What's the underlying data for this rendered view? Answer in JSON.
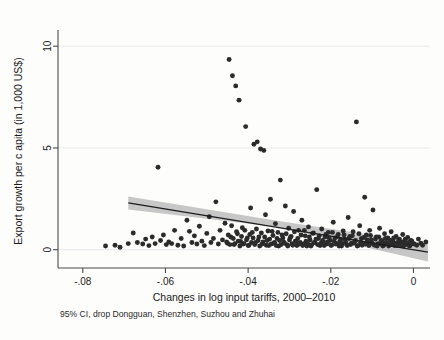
{
  "chart_data": {
    "type": "scatter",
    "title": "",
    "xlabel": "Changes in log input tariffs, 2000–2010",
    "ylabel": "Export growth per c apita (in 1,000 US$)",
    "note": "95% CI, drop Dongguan, Shenzhen, Suzhou and Zhuhai",
    "xlim": [
      -0.086,
      0.004
    ],
    "ylim": [
      -0.9,
      10.6
    ],
    "xticks": [
      -0.08,
      -0.06,
      -0.04,
      -0.02,
      0
    ],
    "xticklabels": [
      "-.08",
      "-.06",
      "-.04",
      "-.02",
      "0"
    ],
    "yticks": [
      0,
      5,
      10
    ],
    "yticklabels": [
      "0",
      "5",
      "10"
    ],
    "grid": "horizontal",
    "legend": "none",
    "marker_color": "#2b2b2b",
    "line_color": "#1c1c1c",
    "ci_color": "#9a9a9a",
    "background_color": "#fdfdfc",
    "series": [
      {
        "name": "Cities",
        "points": [
          [
            -0.0745,
            0.18
          ],
          [
            -0.0722,
            0.22
          ],
          [
            -0.071,
            0.12
          ],
          [
            -0.069,
            0.3
          ],
          [
            -0.0678,
            0.82
          ],
          [
            -0.0668,
            0.35
          ],
          [
            -0.0655,
            0.28
          ],
          [
            -0.0648,
            0.52
          ],
          [
            -0.064,
            0.2
          ],
          [
            -0.0632,
            0.62
          ],
          [
            -0.0625,
            0.3
          ],
          [
            -0.0618,
            4.05
          ],
          [
            -0.0612,
            0.45
          ],
          [
            -0.0605,
            0.72
          ],
          [
            -0.0598,
            0.25
          ],
          [
            -0.0592,
            0.38
          ],
          [
            -0.0585,
            0.3
          ],
          [
            -0.0578,
            0.95
          ],
          [
            -0.057,
            0.22
          ],
          [
            -0.0562,
            0.55
          ],
          [
            -0.0556,
            0.18
          ],
          [
            -0.0548,
            1.45
          ],
          [
            -0.0542,
            0.9
          ],
          [
            -0.0536,
            0.35
          ],
          [
            -0.053,
            0.68
          ],
          [
            -0.0524,
            0.28
          ],
          [
            -0.0518,
            1.15
          ],
          [
            -0.0512,
            0.42
          ],
          [
            -0.0506,
            0.2
          ],
          [
            -0.05,
            0.8
          ],
          [
            -0.0494,
            1.62
          ],
          [
            -0.049,
            0.35
          ],
          [
            -0.0484,
            0.55
          ],
          [
            -0.0478,
            2.35
          ],
          [
            -0.0472,
            0.28
          ],
          [
            -0.0468,
            0.95
          ],
          [
            -0.0462,
            0.48
          ],
          [
            -0.0456,
            1.3
          ],
          [
            -0.045,
            0.32
          ],
          [
            -0.0446,
            9.35
          ],
          [
            -0.0442,
            0.62
          ],
          [
            -0.0438,
            8.55
          ],
          [
            -0.0434,
            0.25
          ],
          [
            -0.043,
            8.05
          ],
          [
            -0.0426,
            0.78
          ],
          [
            -0.0422,
            7.35
          ],
          [
            -0.0418,
            0.4
          ],
          [
            -0.0414,
            1.08
          ],
          [
            -0.041,
            0.3
          ],
          [
            -0.0406,
            6.05
          ],
          [
            -0.0402,
            0.58
          ],
          [
            -0.0398,
            0.22
          ],
          [
            -0.0394,
            2.05
          ],
          [
            -0.039,
            0.85
          ],
          [
            -0.0386,
            5.18
          ],
          [
            -0.0382,
            0.35
          ],
          [
            -0.0378,
            5.3
          ],
          [
            -0.0374,
            0.62
          ],
          [
            -0.037,
            4.95
          ],
          [
            -0.0366,
            0.28
          ],
          [
            -0.0362,
            4.88
          ],
          [
            -0.0358,
            1.72
          ],
          [
            -0.0354,
            0.45
          ],
          [
            -0.035,
            0.2
          ],
          [
            -0.0346,
            2.48
          ],
          [
            -0.0342,
            0.9
          ],
          [
            -0.0338,
            0.32
          ],
          [
            -0.0334,
            1.28
          ],
          [
            -0.033,
            0.55
          ],
          [
            -0.0326,
            0.18
          ],
          [
            -0.0322,
            3.42
          ],
          [
            -0.0318,
            0.72
          ],
          [
            -0.0314,
            0.38
          ],
          [
            -0.031,
            2.15
          ],
          [
            -0.0306,
            0.25
          ],
          [
            -0.0302,
            1.05
          ],
          [
            -0.0298,
            0.6
          ],
          [
            -0.0294,
            0.3
          ],
          [
            -0.029,
            1.88
          ],
          [
            -0.0286,
            0.42
          ],
          [
            -0.0282,
            0.2
          ],
          [
            -0.0278,
            0.95
          ],
          [
            -0.0274,
            0.35
          ],
          [
            -0.027,
            1.45
          ],
          [
            -0.0266,
            0.28
          ],
          [
            -0.0262,
            0.68
          ],
          [
            -0.0258,
            0.18
          ],
          [
            -0.0254,
            1.12
          ],
          [
            -0.025,
            0.48
          ],
          [
            -0.0246,
            0.25
          ],
          [
            -0.0242,
            0.82
          ],
          [
            -0.0238,
            0.35
          ],
          [
            -0.0234,
            2.95
          ],
          [
            -0.023,
            0.55
          ],
          [
            -0.0226,
            0.2
          ],
          [
            -0.0222,
            1.02
          ],
          [
            -0.0218,
            0.38
          ],
          [
            -0.0214,
            0.62
          ],
          [
            -0.021,
            0.28
          ],
          [
            -0.0206,
            0.85
          ],
          [
            -0.0202,
            0.45
          ],
          [
            -0.0198,
            0.22
          ],
          [
            -0.0194,
            1.35
          ],
          [
            -0.019,
            0.58
          ],
          [
            -0.0186,
            0.3
          ],
          [
            -0.0182,
            0.75
          ],
          [
            -0.0178,
            0.4
          ],
          [
            -0.0174,
            0.18
          ],
          [
            -0.017,
            0.92
          ],
          [
            -0.0166,
            0.52
          ],
          [
            -0.0162,
            0.25
          ],
          [
            -0.0158,
            1.58
          ],
          [
            -0.0154,
            0.65
          ],
          [
            -0.015,
            0.32
          ],
          [
            -0.0146,
            0.88
          ],
          [
            -0.0142,
            0.42
          ],
          [
            -0.0138,
            6.28
          ],
          [
            -0.0134,
            0.2
          ],
          [
            -0.013,
            1.18
          ],
          [
            -0.0126,
            0.55
          ],
          [
            -0.0122,
            0.28
          ],
          [
            -0.0118,
            2.58
          ],
          [
            -0.0114,
            0.72
          ],
          [
            -0.011,
            0.35
          ],
          [
            -0.0106,
            0.95
          ],
          [
            -0.0102,
            0.48
          ],
          [
            -0.0098,
            1.95
          ],
          [
            -0.0094,
            0.22
          ],
          [
            -0.009,
            0.62
          ],
          [
            -0.0086,
            0.3
          ],
          [
            -0.0082,
            1.05
          ],
          [
            -0.0078,
            0.45
          ],
          [
            -0.0074,
            0.18
          ],
          [
            -0.007,
            0.78
          ],
          [
            -0.0066,
            0.35
          ],
          [
            -0.0062,
            0.58
          ],
          [
            -0.0058,
            0.25
          ],
          [
            -0.0054,
            0.88
          ],
          [
            -0.005,
            0.4
          ],
          [
            -0.0046,
            0.2
          ],
          [
            -0.0042,
            0.65
          ],
          [
            -0.0038,
            0.32
          ],
          [
            -0.0034,
            0.52
          ],
          [
            -0.003,
            0.22
          ],
          [
            -0.0026,
            0.75
          ],
          [
            -0.0022,
            0.38
          ],
          [
            -0.0018,
            0.28
          ],
          [
            -0.0014,
            0.6
          ],
          [
            -0.001,
            0.18
          ],
          [
            -0.0006,
            0.45
          ],
          [
            -0.0002,
            0.3
          ],
          [
            0.0012,
            0.52
          ],
          [
            0.0022,
            0.22
          ],
          [
            0.003,
            0.38
          ],
          [
            -0.0452,
            0.38
          ],
          [
            -0.0448,
            0.72
          ],
          [
            -0.0444,
            0.25
          ],
          [
            -0.044,
            1.18
          ],
          [
            -0.0436,
            0.55
          ],
          [
            -0.0432,
            0.3
          ],
          [
            -0.0428,
            0.88
          ],
          [
            -0.0424,
            0.42
          ],
          [
            -0.042,
            0.18
          ],
          [
            -0.0416,
            0.65
          ],
          [
            -0.0412,
            0.28
          ],
          [
            -0.0408,
            0.95
          ],
          [
            -0.0404,
            0.48
          ],
          [
            -0.04,
            0.2
          ],
          [
            -0.0396,
            0.75
          ],
          [
            -0.0392,
            0.35
          ],
          [
            -0.0388,
            0.58
          ],
          [
            -0.0384,
            0.25
          ],
          [
            -0.038,
            1.02
          ],
          [
            -0.0376,
            0.45
          ],
          [
            -0.0372,
            0.18
          ],
          [
            -0.0368,
            0.82
          ],
          [
            -0.0364,
            0.38
          ],
          [
            -0.036,
            0.62
          ],
          [
            -0.0356,
            0.22
          ],
          [
            -0.0352,
            0.92
          ],
          [
            -0.0348,
            0.52
          ],
          [
            -0.0344,
            0.28
          ],
          [
            -0.034,
            0.7
          ],
          [
            -0.0336,
            0.35
          ],
          [
            -0.0332,
            0.2
          ],
          [
            -0.0328,
            0.85
          ],
          [
            -0.0324,
            0.45
          ],
          [
            -0.032,
            0.25
          ],
          [
            -0.0316,
            0.58
          ],
          [
            -0.0312,
            0.32
          ],
          [
            -0.0308,
            0.78
          ],
          [
            -0.0304,
            0.18
          ],
          [
            -0.03,
            0.48
          ],
          [
            -0.0296,
            0.65
          ],
          [
            -0.0292,
            0.22
          ],
          [
            -0.0288,
            0.88
          ],
          [
            -0.0284,
            0.38
          ],
          [
            -0.028,
            0.55
          ],
          [
            -0.0276,
            0.28
          ],
          [
            -0.0272,
            0.72
          ],
          [
            -0.0268,
            0.2
          ],
          [
            -0.0264,
            0.95
          ],
          [
            -0.026,
            0.42
          ],
          [
            -0.0256,
            0.3
          ],
          [
            -0.0252,
            0.62
          ],
          [
            -0.0248,
            0.18
          ],
          [
            -0.0244,
            0.8
          ],
          [
            -0.024,
            0.35
          ],
          [
            -0.0236,
            0.52
          ],
          [
            -0.0232,
            0.25
          ],
          [
            -0.0228,
            0.68
          ],
          [
            -0.0224,
            0.32
          ],
          [
            -0.022,
            0.45
          ],
          [
            -0.0216,
            0.2
          ],
          [
            -0.0212,
            0.75
          ],
          [
            -0.0208,
            0.38
          ],
          [
            -0.0204,
            0.58
          ],
          [
            -0.02,
            0.22
          ],
          [
            -0.0196,
            0.85
          ],
          [
            -0.0192,
            0.42
          ],
          [
            -0.0188,
            0.28
          ],
          [
            -0.0184,
            0.65
          ],
          [
            -0.018,
            0.18
          ],
          [
            -0.0176,
            0.5
          ],
          [
            -0.0172,
            0.3
          ],
          [
            -0.0168,
            0.72
          ],
          [
            -0.0164,
            0.38
          ],
          [
            -0.016,
            0.2
          ],
          [
            -0.0156,
            0.55
          ],
          [
            -0.0152,
            0.25
          ],
          [
            -0.0148,
            0.68
          ],
          [
            -0.0144,
            0.32
          ],
          [
            -0.014,
            0.45
          ],
          [
            -0.0136,
            0.18
          ],
          [
            -0.0132,
            0.78
          ],
          [
            -0.0128,
            0.35
          ],
          [
            -0.0124,
            0.22
          ],
          [
            -0.012,
            0.6
          ],
          [
            -0.0116,
            0.28
          ],
          [
            -0.0112,
            0.48
          ],
          [
            -0.0108,
            0.2
          ],
          [
            -0.0104,
            0.7
          ],
          [
            -0.01,
            0.32
          ],
          [
            -0.0096,
            0.25
          ],
          [
            -0.0092,
            0.52
          ],
          [
            -0.0088,
            0.18
          ],
          [
            -0.0084,
            0.62
          ],
          [
            -0.008,
            0.28
          ],
          [
            -0.0076,
            0.4
          ],
          [
            -0.0072,
            0.22
          ],
          [
            -0.0068,
            0.55
          ],
          [
            -0.0064,
            0.3
          ],
          [
            -0.006,
            0.18
          ],
          [
            -0.0056,
            0.45
          ],
          [
            -0.0052,
            0.25
          ],
          [
            -0.0048,
            0.58
          ],
          [
            -0.0044,
            0.32
          ],
          [
            -0.004,
            0.2
          ],
          [
            -0.0036,
            0.48
          ],
          [
            -0.0032,
            0.28
          ],
          [
            -0.0028,
            0.38
          ],
          [
            -0.0024,
            0.18
          ],
          [
            -0.002,
            0.52
          ],
          [
            -0.0016,
            0.25
          ],
          [
            -0.0012,
            0.35
          ],
          [
            -0.0008,
            0.2
          ],
          [
            -0.0004,
            0.42
          ],
          [
            0.0002,
            0.28
          ],
          [
            0.0008,
            0.22
          ],
          [
            0.0018,
            0.32
          ]
        ]
      }
    ],
    "fit_line": {
      "name": "Linear fit",
      "x_start": -0.069,
      "y_start": 2.3,
      "x_end": 0.0035,
      "y_end": -0.12
    },
    "ci_band": {
      "name": "95% confidence interval",
      "x_start": -0.069,
      "upper_start": 2.62,
      "lower_start": 1.98,
      "x_mid": -0.033,
      "upper_mid": 1.42,
      "lower_mid": 1.12,
      "x_end": 0.0035,
      "upper_end": 0.3,
      "lower_end": -0.58
    }
  }
}
